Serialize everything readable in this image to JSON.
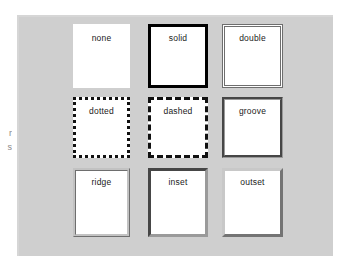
{
  "figure": {
    "panel_background": "#cfcfcf",
    "box_background": "#ffffff",
    "caption_fragments": [
      "r",
      "s"
    ],
    "boxes": [
      {
        "label": "none",
        "style": "none",
        "border_color": "transparent",
        "row": 1,
        "col": 1
      },
      {
        "label": "solid",
        "style": "solid",
        "border_color": "#000000",
        "row": 1,
        "col": 2
      },
      {
        "label": "double",
        "style": "double",
        "border_color": "#6e6e6e",
        "row": 1,
        "col": 3
      },
      {
        "label": "dotted",
        "style": "dotted",
        "border_color": "#111111",
        "row": 2,
        "col": 1
      },
      {
        "label": "dashed",
        "style": "dashed",
        "border_color": "#111111",
        "row": 2,
        "col": 2
      },
      {
        "label": "groove",
        "style": "groove",
        "border_color": "#9a9a9a",
        "row": 2,
        "col": 3
      },
      {
        "label": "ridge",
        "style": "ridge",
        "border_color": "#c2c2c2",
        "row": 3,
        "col": 1
      },
      {
        "label": "inset",
        "style": "inset",
        "border_color": "#9a9a9a",
        "row": 3,
        "col": 2
      },
      {
        "label": "outset",
        "style": "outset",
        "border_color": "#c8c8c8",
        "row": 3,
        "col": 3
      }
    ]
  }
}
